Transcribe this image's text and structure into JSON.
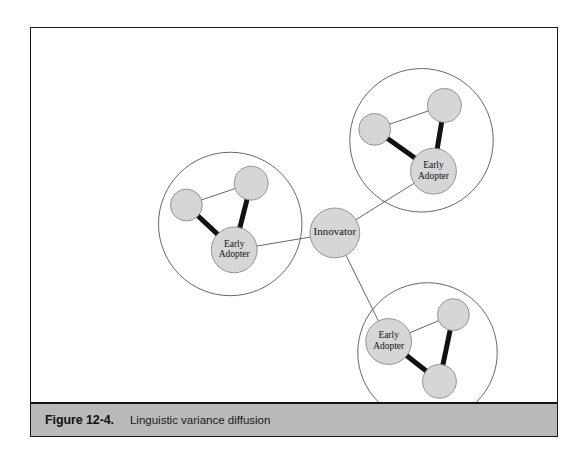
{
  "figure": {
    "caption_number": "Figure 12-4.",
    "caption_text": "Linguistic variance diffusion",
    "border_color": "#1b1b1b",
    "caption_band_color": "#b9b9b9",
    "background_color": "#ffffff"
  },
  "diagram": {
    "type": "network-graph",
    "node_fill": "#d6d6d6",
    "node_stroke": "#8a8a8a",
    "cluster_stroke": "#555555",
    "thin_edge_color": "#555555",
    "thick_edge_color": "#111111",
    "label_color": "#111111",
    "nodes": [
      {
        "id": "innovator",
        "label": "Innovator",
        "label_lines": [
          "Innovator"
        ],
        "x": 305,
        "y": 205,
        "r": 25,
        "type": "innovator",
        "font_size": 11
      },
      {
        "id": "ea-left",
        "label": "Early Adopter",
        "label_lines": [
          "Early",
          "Adopter"
        ],
        "x": 204,
        "y": 222,
        "r": 23,
        "type": "early-adopter",
        "font_size": 9.5
      },
      {
        "id": "ea-topright",
        "label": "Early Adopter",
        "label_lines": [
          "Early",
          "Adopter"
        ],
        "x": 404,
        "y": 143,
        "r": 23,
        "type": "early-adopter",
        "font_size": 9.5
      },
      {
        "id": "ea-bottom",
        "label": "Early Adopter",
        "label_lines": [
          "Early",
          "Adopter"
        ],
        "x": 359,
        "y": 314,
        "r": 23,
        "type": "early-adopter",
        "font_size": 9.5
      },
      {
        "id": "left-a",
        "label": "",
        "label_lines": [],
        "x": 156,
        "y": 177,
        "r": 16,
        "type": "member",
        "font_size": 0
      },
      {
        "id": "left-b",
        "label": "",
        "label_lines": [],
        "x": 221,
        "y": 155,
        "r": 17,
        "type": "member",
        "font_size": 0
      },
      {
        "id": "topright-a",
        "label": "",
        "label_lines": [],
        "x": 345,
        "y": 101,
        "r": 16,
        "type": "member",
        "font_size": 0
      },
      {
        "id": "topright-b",
        "label": "",
        "label_lines": [],
        "x": 415,
        "y": 77,
        "r": 17,
        "type": "member",
        "font_size": 0
      },
      {
        "id": "bottom-a",
        "label": "",
        "label_lines": [],
        "x": 424,
        "y": 287,
        "r": 16,
        "type": "member",
        "font_size": 0
      },
      {
        "id": "bottom-b",
        "label": "",
        "label_lines": [],
        "x": 410,
        "y": 354,
        "r": 17,
        "type": "member",
        "font_size": 0
      }
    ],
    "clusters": [
      {
        "id": "cluster-left",
        "cx": 200,
        "cy": 196,
        "r": 72
      },
      {
        "id": "cluster-topright",
        "cx": 392,
        "cy": 112,
        "r": 72
      },
      {
        "id": "cluster-bottom",
        "cx": 398,
        "cy": 325,
        "r": 70
      }
    ],
    "edges": [
      {
        "id": "innovator-ea-left",
        "from": "innovator",
        "to": "ea-left",
        "weight": "thin"
      },
      {
        "id": "innovator-ea-topright",
        "from": "innovator",
        "to": "ea-topright",
        "weight": "thin"
      },
      {
        "id": "innovator-ea-bottom",
        "from": "innovator",
        "to": "ea-bottom",
        "weight": "thin"
      },
      {
        "id": "left-a-left-b",
        "from": "left-a",
        "to": "left-b",
        "weight": "thin"
      },
      {
        "id": "left-a-ea",
        "from": "left-a",
        "to": "ea-left",
        "weight": "thick"
      },
      {
        "id": "left-b-ea",
        "from": "left-b",
        "to": "ea-left",
        "weight": "thick"
      },
      {
        "id": "topright-a-topright-b",
        "from": "topright-a",
        "to": "topright-b",
        "weight": "thin"
      },
      {
        "id": "topright-a-ea",
        "from": "topright-a",
        "to": "ea-topright",
        "weight": "thick"
      },
      {
        "id": "topright-b-ea",
        "from": "topright-b",
        "to": "ea-topright",
        "weight": "thick"
      },
      {
        "id": "bottom-a-ea",
        "from": "bottom-a",
        "to": "ea-bottom",
        "weight": "thin"
      },
      {
        "id": "bottom-a-bottom-b",
        "from": "bottom-a",
        "to": "bottom-b",
        "weight": "thick"
      },
      {
        "id": "bottom-b-ea",
        "from": "bottom-b",
        "to": "ea-bottom",
        "weight": "thick"
      }
    ]
  }
}
